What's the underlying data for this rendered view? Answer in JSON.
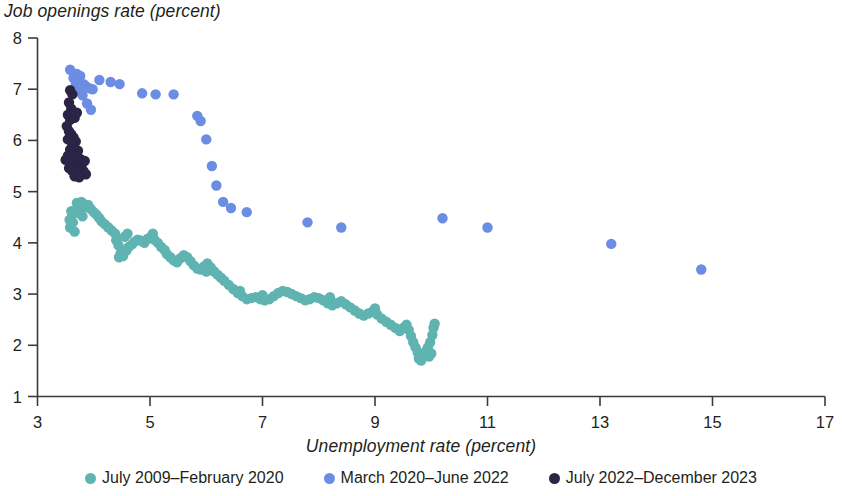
{
  "chart_data": {
    "type": "scatter",
    "title": "",
    "xlabel": "Unemployment rate (percent)",
    "ylabel": "Job openings rate (percent)",
    "xlim": [
      3,
      17
    ],
    "ylim": [
      1,
      8
    ],
    "xticks": [
      3,
      5,
      7,
      9,
      11,
      13,
      15,
      17
    ],
    "yticks": [
      1,
      2,
      3,
      4,
      5,
      6,
      7,
      8
    ],
    "xtick_labels": [
      "3",
      "5",
      "7",
      "9",
      "11",
      "13",
      "15",
      "17"
    ],
    "ytick_labels": [
      "1",
      "2",
      "3",
      "4",
      "5",
      "6",
      "7",
      "8"
    ],
    "grid": false,
    "legend_position": "bottom",
    "marker_radius": 5.2,
    "series": [
      {
        "name": "July 2009–February 2020",
        "color": "#5FB3B0",
        "points": [
          [
            3.6,
            4.62
          ],
          [
            3.62,
            4.55
          ],
          [
            3.57,
            4.45
          ],
          [
            3.63,
            4.4
          ],
          [
            3.58,
            4.3
          ],
          [
            3.66,
            4.22
          ],
          [
            3.72,
            4.7
          ],
          [
            3.7,
            4.78
          ],
          [
            3.78,
            4.8
          ],
          [
            3.82,
            4.76
          ],
          [
            3.86,
            4.7
          ],
          [
            3.9,
            4.74
          ],
          [
            3.68,
            4.64
          ],
          [
            3.74,
            4.58
          ],
          [
            3.8,
            4.52
          ],
          [
            3.95,
            4.66
          ],
          [
            4.0,
            4.6
          ],
          [
            4.05,
            4.55
          ],
          [
            4.1,
            4.48
          ],
          [
            4.14,
            4.42
          ],
          [
            4.2,
            4.36
          ],
          [
            4.26,
            4.3
          ],
          [
            4.32,
            4.24
          ],
          [
            4.38,
            4.18
          ],
          [
            4.4,
            4.05
          ],
          [
            4.44,
            3.95
          ],
          [
            4.48,
            3.8
          ],
          [
            4.45,
            3.72
          ],
          [
            4.52,
            3.74
          ],
          [
            4.58,
            3.85
          ],
          [
            4.62,
            3.92
          ],
          [
            4.68,
            3.97
          ],
          [
            4.72,
            4.02
          ],
          [
            4.78,
            4.06
          ],
          [
            4.84,
            4.04
          ],
          [
            4.9,
            4.0
          ],
          [
            4.96,
            4.08
          ],
          [
            5.02,
            4.12
          ],
          [
            5.08,
            4.06
          ],
          [
            5.14,
            4.0
          ],
          [
            5.2,
            3.92
          ],
          [
            5.26,
            3.86
          ],
          [
            5.3,
            3.78
          ],
          [
            5.36,
            3.72
          ],
          [
            5.42,
            3.66
          ],
          [
            5.48,
            3.62
          ],
          [
            5.54,
            3.7
          ],
          [
            5.6,
            3.76
          ],
          [
            5.66,
            3.72
          ],
          [
            5.72,
            3.64
          ],
          [
            5.78,
            3.56
          ],
          [
            5.84,
            3.5
          ],
          [
            5.9,
            3.48
          ],
          [
            5.96,
            3.54
          ],
          [
            6.02,
            3.6
          ],
          [
            6.08,
            3.52
          ],
          [
            6.14,
            3.44
          ],
          [
            6.2,
            3.38
          ],
          [
            6.26,
            3.32
          ],
          [
            6.32,
            3.26
          ],
          [
            6.4,
            3.18
          ],
          [
            6.48,
            3.1
          ],
          [
            6.56,
            3.02
          ],
          [
            6.64,
            2.96
          ],
          [
            6.72,
            2.9
          ],
          [
            6.8,
            2.92
          ],
          [
            6.88,
            2.94
          ],
          [
            6.96,
            2.9
          ],
          [
            7.04,
            2.88
          ],
          [
            7.12,
            2.9
          ],
          [
            7.2,
            2.96
          ],
          [
            7.28,
            3.02
          ],
          [
            7.36,
            3.06
          ],
          [
            7.44,
            3.04
          ],
          [
            7.52,
            3.0
          ],
          [
            7.6,
            2.96
          ],
          [
            7.68,
            2.92
          ],
          [
            7.76,
            2.88
          ],
          [
            7.84,
            2.9
          ],
          [
            7.92,
            2.94
          ],
          [
            8.0,
            2.92
          ],
          [
            8.08,
            2.88
          ],
          [
            8.16,
            2.82
          ],
          [
            8.24,
            2.78
          ],
          [
            8.32,
            2.82
          ],
          [
            8.4,
            2.86
          ],
          [
            8.48,
            2.8
          ],
          [
            8.56,
            2.74
          ],
          [
            8.64,
            2.68
          ],
          [
            8.72,
            2.62
          ],
          [
            8.8,
            2.58
          ],
          [
            8.88,
            2.62
          ],
          [
            8.96,
            2.66
          ],
          [
            9.04,
            2.6
          ],
          [
            9.12,
            2.52
          ],
          [
            9.2,
            2.46
          ],
          [
            9.28,
            2.4
          ],
          [
            9.36,
            2.34
          ],
          [
            9.44,
            2.28
          ],
          [
            9.5,
            2.34
          ],
          [
            9.56,
            2.4
          ],
          [
            9.6,
            2.3
          ],
          [
            9.64,
            2.18
          ],
          [
            9.68,
            2.06
          ],
          [
            9.72,
            1.96
          ],
          [
            9.76,
            1.86
          ],
          [
            9.78,
            1.74
          ],
          [
            9.82,
            1.7
          ],
          [
            9.86,
            1.78
          ],
          [
            9.9,
            1.88
          ],
          [
            9.94,
            1.96
          ],
          [
            9.98,
            2.06
          ],
          [
            10.02,
            2.2
          ],
          [
            10.04,
            2.34
          ],
          [
            10.06,
            2.42
          ],
          [
            10.0,
            1.84
          ],
          [
            9.96,
            1.78
          ],
          [
            4.55,
            4.12
          ],
          [
            4.6,
            4.18
          ],
          [
            5.05,
            4.18
          ],
          [
            6.0,
            3.44
          ],
          [
            6.6,
            3.06
          ],
          [
            7.0,
            2.98
          ],
          [
            8.2,
            2.94
          ],
          [
            9.0,
            2.72
          ]
        ]
      },
      {
        "name": "March 2020–June 2022",
        "color": "#6B8DE3",
        "points": [
          [
            3.58,
            7.38
          ],
          [
            3.64,
            7.22
          ],
          [
            3.7,
            7.3
          ],
          [
            3.76,
            7.26
          ],
          [
            3.82,
            7.1
          ],
          [
            3.86,
            7.06
          ],
          [
            3.92,
            7.02
          ],
          [
            3.98,
            7.0
          ],
          [
            3.74,
            6.96
          ],
          [
            3.8,
            6.88
          ],
          [
            3.68,
            7.12
          ],
          [
            3.88,
            6.72
          ],
          [
            4.3,
            7.14
          ],
          [
            4.46,
            7.1
          ],
          [
            4.86,
            6.92
          ],
          [
            5.1,
            6.9
          ],
          [
            5.42,
            6.9
          ],
          [
            5.84,
            6.48
          ],
          [
            5.9,
            6.38
          ],
          [
            6.0,
            6.02
          ],
          [
            6.1,
            5.5
          ],
          [
            6.18,
            5.12
          ],
          [
            6.3,
            4.8
          ],
          [
            6.44,
            4.68
          ],
          [
            6.72,
            4.6
          ],
          [
            7.8,
            4.4
          ],
          [
            8.4,
            4.3
          ],
          [
            11.0,
            4.3
          ],
          [
            10.2,
            4.48
          ],
          [
            13.2,
            3.98
          ],
          [
            14.8,
            3.48
          ],
          [
            4.1,
            7.18
          ],
          [
            3.95,
            6.6
          ]
        ]
      },
      {
        "name": "July 2022–December 2023",
        "color": "#2B2545",
        "points": [
          [
            3.58,
            6.98
          ],
          [
            3.62,
            6.9
          ],
          [
            3.56,
            6.74
          ],
          [
            3.6,
            6.62
          ],
          [
            3.54,
            6.5
          ],
          [
            3.58,
            6.4
          ],
          [
            3.52,
            6.28
          ],
          [
            3.56,
            6.18
          ],
          [
            3.6,
            6.12
          ],
          [
            3.54,
            6.02
          ],
          [
            3.64,
            6.06
          ],
          [
            3.68,
            5.98
          ],
          [
            3.62,
            5.9
          ],
          [
            3.58,
            5.82
          ],
          [
            3.66,
            5.76
          ],
          [
            3.72,
            5.8
          ],
          [
            3.7,
            5.7
          ],
          [
            3.64,
            5.62
          ],
          [
            3.6,
            5.54
          ],
          [
            3.56,
            5.46
          ],
          [
            3.62,
            5.4
          ],
          [
            3.74,
            5.52
          ],
          [
            3.78,
            5.46
          ],
          [
            3.82,
            5.4
          ],
          [
            3.86,
            5.34
          ],
          [
            3.7,
            5.36
          ],
          [
            3.66,
            5.3
          ],
          [
            3.74,
            5.28
          ],
          [
            3.8,
            5.56
          ],
          [
            3.76,
            5.64
          ],
          [
            3.84,
            5.6
          ],
          [
            3.5,
            5.62
          ],
          [
            3.54,
            5.7
          ],
          [
            3.66,
            6.44
          ],
          [
            3.7,
            6.54
          ]
        ]
      }
    ]
  },
  "legend": {
    "items": [
      {
        "label": "July 2009–February 2020",
        "color": "#5FB3B0"
      },
      {
        "label": "March 2020–June 2022",
        "color": "#6B8DE3"
      },
      {
        "label": "July 2022–December 2023",
        "color": "#2B2545"
      }
    ]
  }
}
